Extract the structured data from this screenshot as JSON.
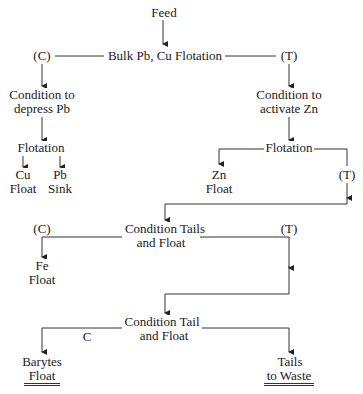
{
  "diagram": {
    "type": "flowchart",
    "nodes": {
      "feed": "Feed",
      "bulk_flotation": "Bulk Pb, Cu Flotation",
      "c1": "(C)",
      "t1": "(T)",
      "depress_pb_1": "Condition to",
      "depress_pb_2": "depress Pb",
      "activate_zn_1": "Condition to",
      "activate_zn_2": "activate Zn",
      "flotation_left": "Flotation",
      "cu_1": "Cu",
      "cu_2": "Float",
      "pb_1": "Pb",
      "pb_2": "Sink",
      "flotation_right": "Flotation",
      "zn_1": "Zn",
      "zn_2": "Float",
      "t2": "(T)",
      "cond_tails_1": "Condition Tails",
      "cond_tails_2": "and Float",
      "c3": "(C)",
      "t3": "(T)",
      "fe_1": "Fe",
      "fe_2": "Float",
      "cond_tail_1": "Condition Tail",
      "cond_tail_2": "and Float",
      "c4": "C",
      "barytes_1": "Barytes",
      "barytes_2": "Float",
      "waste_1": "Tails",
      "waste_2": "to Waste"
    },
    "edges": [
      [
        "Feed",
        "Bulk Pb, Cu Flotation"
      ],
      [
        "Bulk Pb, Cu Flotation",
        "(C) Condition to depress Pb"
      ],
      [
        "Bulk Pb, Cu Flotation",
        "(T) Condition to activate Zn"
      ],
      [
        "Condition to depress Pb",
        "Flotation"
      ],
      [
        "Flotation",
        "Cu Float"
      ],
      [
        "Flotation",
        "Pb Sink"
      ],
      [
        "Condition to activate Zn",
        "Flotation"
      ],
      [
        "Flotation",
        "Zn Float"
      ],
      [
        "Flotation",
        "(T) Condition Tails and Float"
      ],
      [
        "Condition Tails and Float",
        "(C) Fe Float"
      ],
      [
        "Condition Tails and Float",
        "(T) Condition Tail and Float"
      ],
      [
        "Condition Tail and Float",
        "C Barytes Float"
      ],
      [
        "Condition Tail and Float",
        "Tails to Waste"
      ]
    ]
  }
}
